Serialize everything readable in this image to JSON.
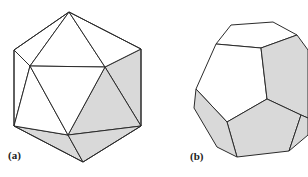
{
  "figure": {
    "panels": [
      {
        "id": "a",
        "label": "(a)",
        "shape": "icosahedron"
      },
      {
        "id": "b",
        "label": "(b)",
        "shape": "truncated polyhedron (dodecahedron-like)"
      }
    ],
    "colors": {
      "background": "#ffffff",
      "edge": "#2b2b2b",
      "face_unshaded": "#ffffff",
      "face_shaded": "#d9d9d9"
    }
  }
}
